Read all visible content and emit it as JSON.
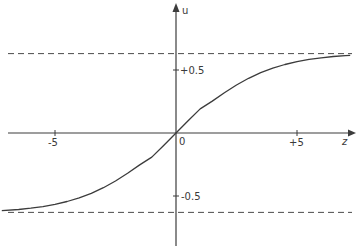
{
  "chart_data": {
    "type": "line",
    "title": "",
    "xlabel": "z",
    "ylabel": "u",
    "x_ticks": [
      {
        "value": -5,
        "label": "-5"
      },
      {
        "value": 0,
        "label": "0"
      },
      {
        "value": 5,
        "label": "+5"
      }
    ],
    "y_ticks": [
      {
        "value": 0.5,
        "label": "+0.5"
      },
      {
        "value": -0.5,
        "label": "-0.5"
      }
    ],
    "asymptotes": [
      0.63,
      -0.63
    ],
    "xlim": [
      -7.3,
      7.3
    ],
    "ylim": [
      -0.85,
      1.0
    ],
    "grid": false,
    "legend": null,
    "series": [
      {
        "name": "u(z)",
        "style": "solid",
        "x": [
          -7.2,
          -6.5,
          -6,
          -5.5,
          -5,
          -4.5,
          -4,
          -3.5,
          -3,
          -2.5,
          -2,
          -1.5,
          -1,
          -0.5,
          0,
          0.5,
          1,
          1.5,
          2,
          2.5,
          3,
          3.5,
          4,
          4.5,
          5,
          5.5,
          6,
          6.5,
          7,
          7.2
        ],
        "y": [
          -0.616,
          -0.607,
          -0.597,
          -0.584,
          -0.567,
          -0.544,
          -0.515,
          -0.479,
          -0.434,
          -0.381,
          -0.32,
          -0.253,
          -0.191,
          -0.098,
          0.0,
          0.098,
          0.191,
          0.253,
          0.32,
          0.381,
          0.434,
          0.479,
          0.515,
          0.544,
          0.567,
          0.584,
          0.597,
          0.607,
          0.614,
          0.616
        ]
      }
    ]
  },
  "axes": {
    "x_label": "z",
    "y_label": "u",
    "origin_label": "0",
    "x_tick_labels": [
      "-5",
      "+5"
    ],
    "y_tick_labels": [
      "+0.5",
      "-0.5"
    ]
  },
  "colors": {
    "line": "#3c3c3c",
    "axis": "#3c3c3c",
    "dash": "#4a4a4a",
    "text": "#3a3a3a",
    "background": "#ffffff"
  }
}
